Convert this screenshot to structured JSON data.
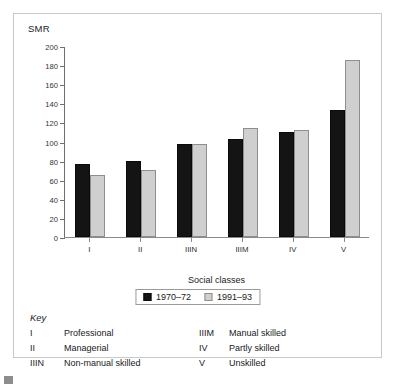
{
  "figure": {
    "y_axis_title": "SMR",
    "x_axis_title": "Social classes"
  },
  "legend": {
    "items": [
      {
        "label": "1970–72",
        "color": "#141414",
        "swatch": "black-square-swatch"
      },
      {
        "label": "1991–93",
        "color": "#cfcfcf",
        "swatch": "grey-square-swatch"
      }
    ]
  },
  "key": {
    "title": "Key",
    "left_column": [
      {
        "code": "I",
        "text": "Professional"
      },
      {
        "code": "II",
        "text": "Managerial"
      },
      {
        "code": "IIIN",
        "text": "Non-manual skilled"
      }
    ],
    "right_column": [
      {
        "code": "IIIM",
        "text": "Manual skilled"
      },
      {
        "code": "IV",
        "text": "Partly skilled"
      },
      {
        "code": "V",
        "text": "Unskilled"
      }
    ]
  },
  "chart_data": {
    "type": "bar",
    "title": "",
    "xlabel": "Social classes",
    "ylabel": "SMR",
    "ylim": [
      0,
      200
    ],
    "yticks": [
      0,
      20,
      40,
      60,
      80,
      100,
      120,
      140,
      160,
      180,
      200
    ],
    "grid": false,
    "legend_position": "below-axis",
    "categories": [
      "I",
      "II",
      "IIIN",
      "IIIM",
      "IV",
      "V"
    ],
    "series": [
      {
        "name": "1970–72",
        "color": "#141414",
        "values": [
          76,
          80,
          97,
          103,
          110,
          133
        ]
      },
      {
        "name": "1991–93",
        "color": "#cfcfcf",
        "values": [
          65,
          70,
          97,
          114,
          112,
          185
        ]
      }
    ]
  }
}
